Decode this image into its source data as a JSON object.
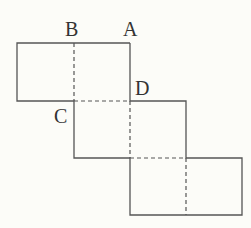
{
  "diagram": {
    "type": "cube-net",
    "labels": {
      "A": "A",
      "B": "B",
      "C": "C",
      "D": "D"
    },
    "colors": {
      "background": "#fcfcf8",
      "line": "#555555",
      "text": "#333333"
    },
    "faces": 6
  }
}
